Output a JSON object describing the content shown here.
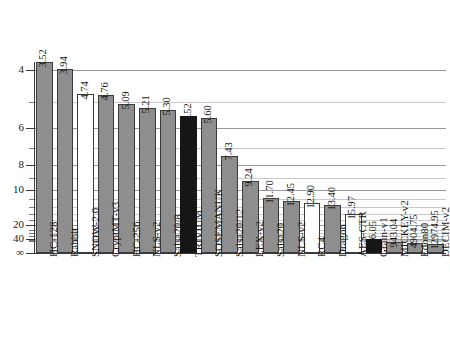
{
  "chart_data": {
    "type": "bar",
    "title": "",
    "subtitle": "",
    "xlabel": "",
    "ylabel": "",
    "grid": true,
    "legend": null,
    "y_axis": {
      "scale": "log",
      "inverted": true,
      "note": "Lower value = faster; axis runs 4 at top to infinity at the baseline",
      "major_ticks": [
        "4",
        "6",
        "8",
        "10",
        "20",
        "40",
        "∞"
      ],
      "major_tick_values": [
        4,
        6,
        8,
        10,
        20,
        40,
        0
      ],
      "minor_tick_values": [
        5,
        7,
        9,
        12,
        14,
        16,
        18,
        25,
        30,
        35,
        50,
        70,
        100,
        300
      ]
    },
    "categories": [
      "HC-128",
      "Rabbit",
      "SNOW-2.0",
      "CryptMT-v3",
      "HC-256",
      "NLS-v2",
      "Salsa20/8",
      "TRIVIUM",
      "SOSEMANUK",
      "Salsa20/12",
      "LEX-v2",
      "Salsa20",
      "NLS-v2",
      "RC4",
      "Dragon",
      "AES-CTR",
      "Grain-v1",
      "MICKEY-v2",
      "Edon80",
      "DECIM-v2"
    ],
    "values": [
      3.52,
      3.94,
      4.74,
      4.76,
      5.09,
      5.21,
      5.3,
      5.52,
      5.6,
      7.43,
      9.24,
      11.7,
      12.45,
      12.9,
      13.4,
      15.97,
      56.05,
      943.04,
      4904.75,
      12974.95
    ],
    "value_labels": [
      "3.52",
      "3.94",
      "4.74",
      "4.76",
      "5.09",
      "5.21",
      "5.30",
      "5.52",
      "5.60",
      "7.43",
      "9.24",
      "11.70",
      "12.45",
      "12.90",
      "13.40",
      "15.97",
      "56.05",
      "943.04",
      "4904.75",
      "12974.95"
    ],
    "bar_styles": [
      "gray",
      "gray",
      "white",
      "gray",
      "gray",
      "gray",
      "gray",
      "black",
      "gray",
      "gray",
      "gray",
      "gray",
      "gray",
      "white",
      "gray",
      "white",
      "black",
      "gray",
      "gray",
      "gray"
    ],
    "colors": {
      "gray": "#8e8e8e",
      "white": "#ffffff",
      "black": "#161616",
      "bar_outline": "#3b3b3b",
      "grid_major": "#9a9a9a",
      "grid_minor": "#c9c9c9",
      "axis": "#3a3a3a",
      "text": "#1a1a1a"
    }
  }
}
